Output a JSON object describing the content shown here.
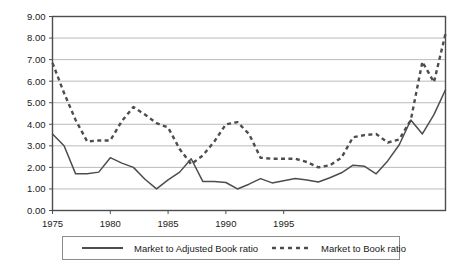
{
  "chart_data": {
    "type": "line",
    "title": "",
    "subtitle": "",
    "xlabel": "",
    "ylabel": "",
    "xlim": [
      1975,
      1999
    ],
    "ylim": [
      0.0,
      9.0
    ],
    "grid": true,
    "grid_axis": "y",
    "legend_position": "bottom",
    "x": [
      1975,
      1976,
      1977,
      1978,
      1979,
      1980,
      1981,
      1982,
      1983,
      1984,
      1985,
      1986,
      1987,
      1988,
      1989,
      1990,
      1991,
      1992,
      1993,
      1994,
      1995,
      1996,
      1997,
      1998,
      1999
    ],
    "xticks": [
      1975,
      1980,
      1985,
      1990,
      1995
    ],
    "xtick_labels": [
      "1975",
      "1980",
      "1985",
      "1990",
      "1995"
    ],
    "yticks": [
      0.0,
      1.0,
      2.0,
      3.0,
      4.0,
      5.0,
      6.0,
      7.0,
      8.0,
      9.0
    ],
    "ytick_labels": [
      "0.00",
      "1.00",
      "2.00",
      "3.00",
      "4.00",
      "5.00",
      "6.00",
      "7.00",
      "8.00",
      "9.00"
    ],
    "series": [
      {
        "name": "Market to Adjusted Book ratio",
        "style": "solid",
        "color": "#4d4d4d",
        "values": [
          3.55,
          3.0,
          1.7,
          1.7,
          1.75,
          2.45,
          2.2,
          2.0,
          1.45,
          1.0,
          1.4,
          1.75,
          2.4,
          1.35,
          1.35,
          1.3,
          1.0,
          1.2,
          1.45,
          1.25,
          1.35,
          1.45,
          1.4,
          1.3,
          1.5
        ]
      },
      {
        "name": "Market to Book ratio",
        "style": "dashed",
        "color": "#4d4d4d",
        "values": [
          6.85,
          5.45,
          4.2,
          3.2,
          3.25,
          3.25,
          4.15,
          4.8,
          4.45,
          4.05,
          3.85,
          2.85,
          2.15,
          2.55,
          3.2,
          4.0,
          4.1,
          3.55,
          2.45,
          2.4,
          2.4,
          2.4,
          2.25,
          2.0,
          2.1
        ]
      }
    ],
    "series_full": {
      "solid_points": [
        [
          1975,
          3.55
        ],
        [
          1976,
          3.0
        ],
        [
          1977,
          1.7
        ],
        [
          1978,
          1.7
        ],
        [
          1979,
          1.78
        ],
        [
          1980,
          2.45
        ],
        [
          1981,
          2.2
        ],
        [
          1982,
          2.0
        ],
        [
          1983,
          1.45
        ],
        [
          1984,
          1.0
        ],
        [
          1985,
          1.42
        ],
        [
          1986,
          1.78
        ],
        [
          1987,
          2.4
        ],
        [
          1988,
          1.35
        ],
        [
          1989,
          1.35
        ],
        [
          1990,
          1.3
        ],
        [
          1991,
          1.0
        ],
        [
          1992,
          1.22
        ],
        [
          1993,
          1.48
        ],
        [
          1994,
          1.28
        ],
        [
          1995,
          1.38
        ],
        [
          1996,
          1.48
        ],
        [
          1997,
          1.42
        ],
        [
          1998,
          1.32
        ],
        [
          1999,
          1.52
        ],
        [
          2000,
          1.75
        ],
        [
          2001,
          2.1
        ],
        [
          2002,
          2.05
        ],
        [
          2003,
          1.7
        ],
        [
          2004,
          2.3
        ],
        [
          2005,
          3.05
        ],
        [
          2006,
          4.2
        ],
        [
          2007,
          3.55
        ],
        [
          2008,
          4.45
        ],
        [
          2009,
          5.6
        ]
      ],
      "dashed_points": [
        [
          1975,
          6.85
        ],
        [
          1976,
          5.45
        ],
        [
          1977,
          4.2
        ],
        [
          1978,
          3.2
        ],
        [
          1979,
          3.25
        ],
        [
          1980,
          3.25
        ],
        [
          1981,
          4.15
        ],
        [
          1982,
          4.8
        ],
        [
          1983,
          4.45
        ],
        [
          1984,
          4.05
        ],
        [
          1985,
          3.85
        ],
        [
          1986,
          2.85
        ],
        [
          1987,
          2.15
        ],
        [
          1988,
          2.55
        ],
        [
          1989,
          3.2
        ],
        [
          1990,
          4.0
        ],
        [
          1991,
          4.1
        ],
        [
          1992,
          3.55
        ],
        [
          1993,
          2.45
        ],
        [
          1994,
          2.4
        ],
        [
          1995,
          2.4
        ],
        [
          1996,
          2.4
        ],
        [
          1997,
          2.25
        ],
        [
          1998,
          2.0
        ],
        [
          1999,
          2.1
        ],
        [
          2000,
          2.45
        ],
        [
          2001,
          3.4
        ],
        [
          2002,
          3.5
        ],
        [
          2003,
          3.55
        ],
        [
          2004,
          3.15
        ],
        [
          2005,
          3.3
        ],
        [
          2006,
          4.2
        ],
        [
          2007,
          6.9
        ],
        [
          2008,
          5.95
        ],
        [
          2009,
          8.2
        ]
      ]
    }
  },
  "legend": {
    "entries": [
      {
        "label": "Market to Adjusted Book ratio",
        "style": "solid"
      },
      {
        "label": "Market to Book ratio",
        "style": "dashed"
      }
    ]
  },
  "axis": {
    "y_labels": [
      "9.00",
      "8.00",
      "7.00",
      "6.00",
      "5.00",
      "4.00",
      "3.00",
      "2.00",
      "1.00",
      "0.00"
    ],
    "x_labels": [
      "1975",
      "1980",
      "1985",
      "1990",
      "1995"
    ]
  },
  "colors": {
    "line": "#4d4d4d",
    "frame": "#4d4d4d",
    "grid": "#b3b3b3",
    "background": "#ffffff",
    "text": "#1a1a1a"
  }
}
